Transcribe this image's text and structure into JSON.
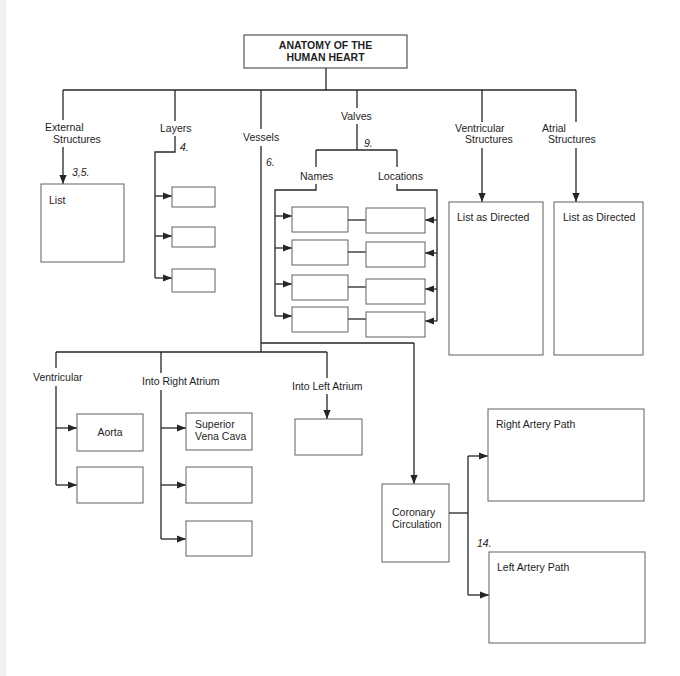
{
  "title": {
    "line1": "ANATOMY OF THE",
    "line2": "HUMAN HEART"
  },
  "branches": {
    "external": {
      "label_lines": [
        "External",
        "Structures"
      ],
      "step": "3,5.",
      "box_label": "List"
    },
    "layers": {
      "label": "Layers",
      "step": "4.",
      "boxes": [
        "",
        "",
        ""
      ]
    },
    "vessels": {
      "label": "Vessels",
      "step": "6."
    },
    "valves": {
      "label": "Valves",
      "step": "9.",
      "names_label": "Names",
      "locations_label": "Locations",
      "name_boxes": [
        "",
        "",
        "",
        ""
      ],
      "location_boxes": [
        "",
        "",
        "",
        ""
      ]
    },
    "ventricular_structures": {
      "label_lines": [
        "Ventricular",
        "Structures"
      ],
      "box_label": "List as Directed"
    },
    "atrial_structures": {
      "label_lines": [
        "Atrial",
        "Structures"
      ],
      "box_label": "List as Directed"
    }
  },
  "vessel_groups": {
    "ventricular": {
      "label": "Ventricular",
      "boxes": [
        "Aorta",
        ""
      ]
    },
    "into_right_atrium": {
      "label": "Into Right Atrium",
      "boxes": [
        [
          "Superior",
          "Vena Cava"
        ],
        "",
        ""
      ]
    },
    "into_left_atrium": {
      "label": "Into Left Atrium",
      "boxes": [
        ""
      ]
    },
    "coronary": {
      "label_lines": [
        "Coronary",
        "Circulation"
      ],
      "step": "14.",
      "right_path": "Right Artery Path",
      "left_path": "Left Artery Path"
    }
  },
  "colors": {
    "line": "#262626",
    "box_border": "#6e6e6e",
    "background": "#ffffff"
  }
}
